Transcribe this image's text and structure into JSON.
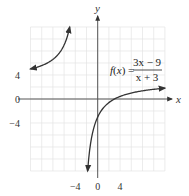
{
  "chart_data": {
    "type": "line",
    "title": "",
    "function_label": {
      "lhs": "f(x) =",
      "numerator": "3x − 9",
      "denominator": "x + 3"
    },
    "expression": "f(x) = (3x - 9)/(x + 3)",
    "xlabel": "x",
    "ylabel": "y",
    "xlim": [
      -12,
      12
    ],
    "ylim": [
      -12,
      12
    ],
    "grid": true,
    "grid_step": 2,
    "x_ticks": [
      {
        "value": -4,
        "label": "−4"
      },
      {
        "value": 0,
        "label": "0"
      },
      {
        "value": 4,
        "label": "4"
      }
    ],
    "y_ticks": [
      {
        "value": 4,
        "label": "4"
      },
      {
        "value": 0,
        "label": "0"
      },
      {
        "value": -4,
        "label": "−4"
      }
    ],
    "vertical_asymptote": -3,
    "horizontal_asymptote": 3,
    "series": [
      {
        "name": "left branch",
        "x_range": [
          -12,
          -5
        ],
        "points": [
          [
            -12,
            5
          ],
          [
            -10,
            5.57
          ],
          [
            -8,
            6.6
          ],
          [
            -7,
            7.5
          ],
          [
            -6,
            9
          ],
          [
            -5,
            12
          ]
        ],
        "arrows": "both"
      },
      {
        "name": "right branch",
        "x_range": [
          -1.8,
          12
        ],
        "points": [
          [
            -1.8,
            -12
          ],
          [
            -1,
            -6
          ],
          [
            0,
            -3
          ],
          [
            2,
            -0.6
          ],
          [
            3,
            0
          ],
          [
            4,
            0.43
          ],
          [
            6,
            1
          ],
          [
            8,
            1.36
          ],
          [
            10,
            1.62
          ],
          [
            12,
            1.8
          ]
        ],
        "arrows": "both"
      }
    ],
    "colors": {
      "curve": "#333333",
      "axis": "#555555",
      "grid": "#e4e4e4"
    }
  }
}
